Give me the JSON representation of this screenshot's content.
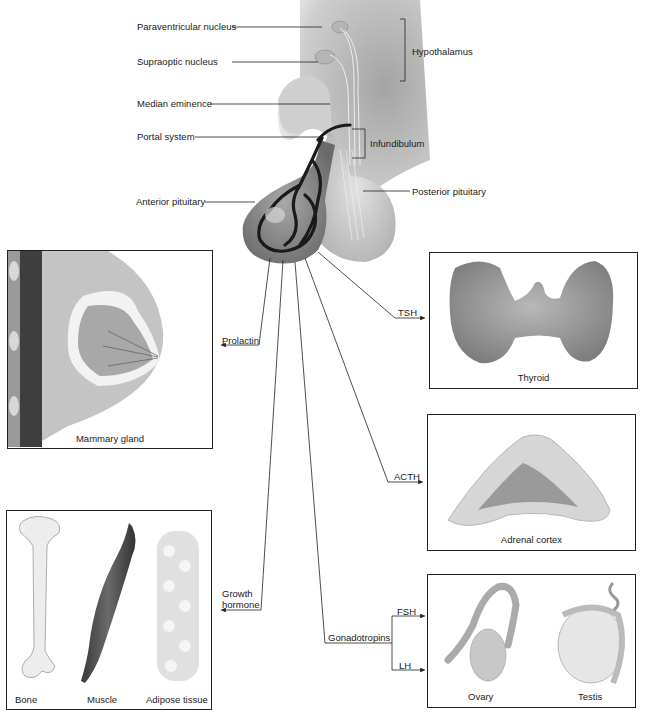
{
  "diagram": {
    "type": "anatomical-flow",
    "source": {
      "labels": {
        "paraventricular": "Paraventricular nucleus",
        "supraoptic": "Supraoptic nucleus",
        "median_eminence": "Median eminence",
        "portal_system": "Portal system",
        "anterior_pituitary": "Anterior pituitary",
        "hypothalamus": "Hypothalamus",
        "infundibulum": "Infundibulum",
        "posterior_pituitary": "Posterior pituitary"
      }
    },
    "hormones": {
      "prolactin": "Prolactin",
      "tsh": "TSH",
      "acth": "ACTH",
      "growth_hormone_line1": "Growth",
      "growth_hormone_line2": "hormone",
      "gonadotropins": "Gonadotropins",
      "fsh": "FSH",
      "lh": "LH"
    },
    "targets": {
      "mammary": "Mammary gland",
      "thyroid": "Thyroid",
      "adrenal": "Adrenal cortex",
      "bone": "Bone",
      "muscle": "Muscle",
      "adipose": "Adipose tissue",
      "ovary": "Ovary",
      "testis": "Testis"
    },
    "edges": [
      {
        "from": "Anterior pituitary",
        "hormone": "Prolactin",
        "to": "Mammary gland"
      },
      {
        "from": "Anterior pituitary",
        "hormone": "TSH",
        "to": "Thyroid"
      },
      {
        "from": "Anterior pituitary",
        "hormone": "ACTH",
        "to": "Adrenal cortex"
      },
      {
        "from": "Anterior pituitary",
        "hormone": "Growth hormone",
        "to": [
          "Bone",
          "Muscle",
          "Adipose tissue"
        ]
      },
      {
        "from": "Anterior pituitary",
        "hormone": "Gonadotropins",
        "branches": [
          "FSH",
          "LH"
        ],
        "to": [
          "Ovary",
          "Testis"
        ]
      }
    ]
  }
}
